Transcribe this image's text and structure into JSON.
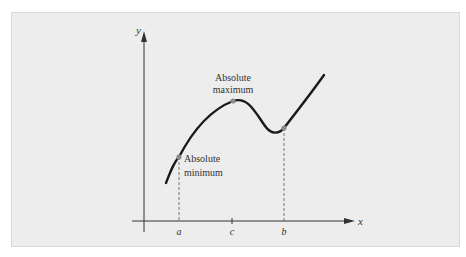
{
  "figure": {
    "axes": {
      "x_label": "x",
      "y_label": "y"
    },
    "ticks": [
      {
        "id": "a",
        "label": "a"
      },
      {
        "id": "c",
        "label": "c"
      },
      {
        "id": "b",
        "label": "b"
      }
    ],
    "annotations": {
      "max_line1": "Absolute",
      "max_line2": "maximum",
      "min_line1": "Absolute",
      "min_line2": "minimum"
    },
    "colors": {
      "panel_bg": "#ededed",
      "curve": "#1a1a1a",
      "points": "#8a8a8a",
      "axis": "#333333"
    }
  }
}
